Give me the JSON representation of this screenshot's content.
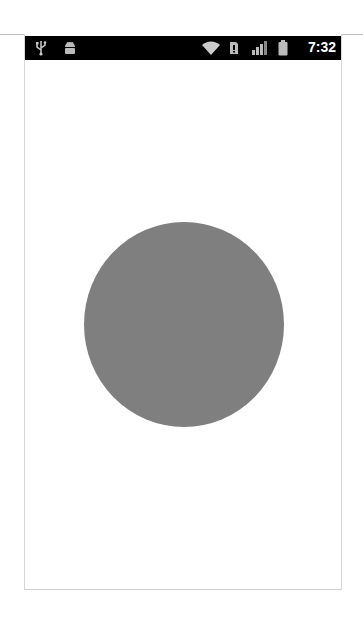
{
  "status_bar": {
    "left_icons": [
      "usb-icon",
      "android-debug-icon"
    ],
    "right_icons": [
      "wifi-icon",
      "sim-icon",
      "signal-icon",
      "battery-icon"
    ],
    "time": "7:32",
    "background": "#000000"
  },
  "canvas": {
    "background": "#ffffff",
    "shape": {
      "type": "circle",
      "color": "#7f7f7f"
    }
  }
}
